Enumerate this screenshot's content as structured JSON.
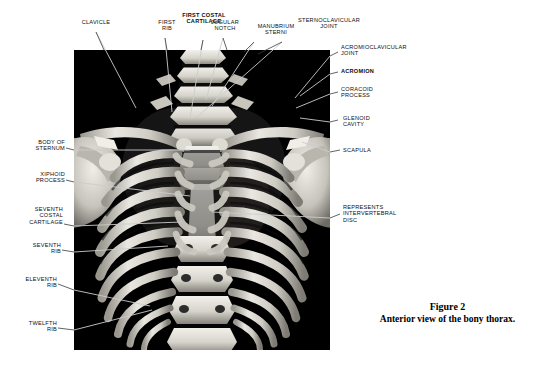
{
  "figure": {
    "caption_number": "Figure 2",
    "caption_text": "Anterior view of the bony thorax.",
    "photo": {
      "subject": "bony-thorax-skeleton",
      "background_color": "#000000",
      "bone_color": "#e8e6e0"
    }
  },
  "labels": {
    "clavicle": "CLAVICLE",
    "first_rib": "FIRST\nRIB",
    "first_costal_cartilage": "FIRST COSTAL\nCARTILAGE",
    "jugular_notch": "JUGULAR\nNOTCH",
    "manubrium_sterni": "MANUBRIUM\nSTERNI",
    "sternoclavicular_joint": "STERNOCLAVICULAR\nJOINT",
    "acromioclavicular_joint": "ACROMIOCLAVICULAR\nJOINT",
    "acromion": "ACROMION",
    "coracoid_process": "CORACOID\nPROCESS",
    "glenoid_cavity": "GLENOID\nCAVITY",
    "scapula": "SCAPULA",
    "body_of_sternum": "BODY OF\nSTERNUM",
    "xiphoid_process": "XIPHOID\nPROCESS",
    "seventh_costal_cartilage": "SEVENTH\nCOSTAL\nCARTILAGE",
    "seventh_rib": "SEVENTH\nRIB",
    "eleventh_rib": "ELEVENTH\nRIB",
    "twelfth_rib": "TWELFTH\nRIB",
    "intervertebral_disc": "REPRESENTS\nINTERVERTEBRAL\nDISC"
  },
  "colors": {
    "page_background": "#ffffff",
    "text": "#0d0d0d",
    "leader_line": "#d9d9d9",
    "leader_line_outside": "#3a3a3a",
    "photo_background": "#000000"
  }
}
